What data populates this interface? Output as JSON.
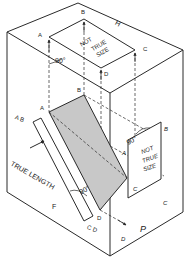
{
  "diagram": {
    "labels": {
      "top_A": "A",
      "top_B": "B",
      "top_C": "C",
      "top_D": "D",
      "top_H": "H",
      "top_not": "NOT",
      "top_true": "TRUE",
      "top_size": "SIZE",
      "top_angle": "90°",
      "front_A": "A",
      "front_B": "B",
      "front_AB": "A B",
      "front_D": "D",
      "front_CD": "C D",
      "front_angle": "90°",
      "true_length": "TRUE LENGTH",
      "front_F": "F",
      "side_A": "A",
      "side_B": "B",
      "side_C1": "C",
      "side_C2": "C",
      "side_D": "D",
      "side_angle": "90°",
      "side_not": "NOT",
      "side_true": "TRUE",
      "side_size": "SIZE",
      "side_P": "P"
    },
    "colors": {
      "line": "#2a2a2a",
      "shade": "#c8c8c8"
    }
  }
}
